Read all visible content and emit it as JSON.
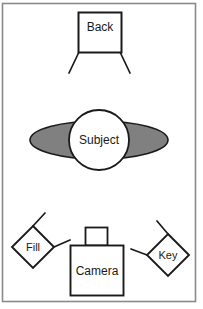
{
  "diagram": {
    "frame": {
      "border_color": "#8a8a8a",
      "background_color": "#ffffff",
      "x": 2,
      "y": 3,
      "width": 194,
      "height": 299
    },
    "stroke_color": "#1a1a1a",
    "fill_white": "#ffffff",
    "shoulder_gray": "#808080",
    "elements": [
      {
        "key": "back",
        "label": "Back",
        "shape": "rectangle-on-stand",
        "role": "back-light",
        "x": 78,
        "y": 12,
        "width": 44,
        "height": 41
      },
      {
        "key": "subject",
        "label": "Subject",
        "shape": "circle-over-ellipse",
        "role": "subject",
        "cx": 99,
        "cy": 140,
        "head_rx": 30,
        "head_ry": 30,
        "body_rx": 69,
        "body_ry": 19
      },
      {
        "key": "fill",
        "label": "Fill",
        "shape": "diamond-with-arms",
        "role": "fill-light",
        "cx": 33,
        "cy": 247,
        "half": 21
      },
      {
        "key": "camera",
        "label": "Camera",
        "shape": "rectangle-with-lens",
        "role": "camera",
        "x": 70,
        "y": 245,
        "width": 54,
        "height": 51,
        "lens_x": 85,
        "lens_y": 227,
        "lens_width": 23,
        "lens_height": 18
      },
      {
        "key": "key",
        "label": "Key",
        "shape": "diamond-with-arms",
        "role": "key-light",
        "cx": 168,
        "cy": 255,
        "half": 21
      }
    ]
  }
}
